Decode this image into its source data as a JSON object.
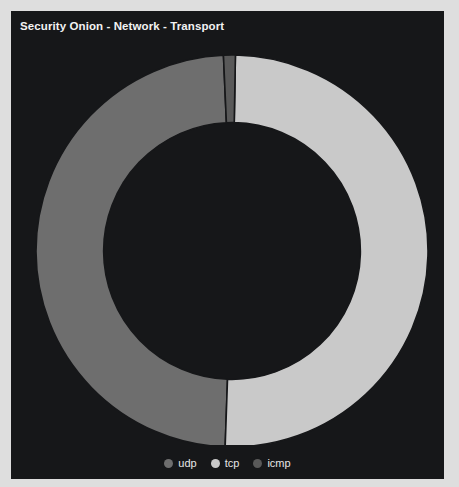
{
  "panel": {
    "title": "Security Onion - Network - Transport",
    "background_color": "#161719",
    "title_color": "#f2f2f2"
  },
  "chart_data": {
    "type": "pie",
    "variant": "donut",
    "title": "Security Onion - Network - Transport",
    "xlabel": "",
    "ylabel": "",
    "grid": false,
    "legend_position": "bottom",
    "start_angle_deg": 0,
    "direction": "counterclockwise",
    "inner_radius_ratio": 0.655,
    "categories": [
      "udp",
      "tcp",
      "icmp"
    ],
    "values": [
      49.0,
      50.3,
      0.7
    ],
    "unit": "percent",
    "slices": [
      {
        "label": "udp",
        "value": 49.0,
        "percent": "49.0%",
        "color": "#6e6e6e",
        "start_angle_deg": 2.5,
        "end_angle_deg": 178.0
      },
      {
        "label": "tcp",
        "value": 50.3,
        "percent": "50.3%",
        "color": "#c9c9c9",
        "start_angle_deg": 178.0,
        "end_angle_deg": 359.0
      },
      {
        "label": "icmp",
        "value": 0.7,
        "percent": "0.7%",
        "color": "#595959",
        "start_angle_deg": 359.0,
        "end_angle_deg": 362.5
      }
    ]
  },
  "legend": {
    "items": [
      {
        "label": "udp",
        "color": "#6e6e6e"
      },
      {
        "label": "tcp",
        "color": "#c9c9c9"
      },
      {
        "label": "icmp",
        "color": "#595959"
      }
    ]
  }
}
